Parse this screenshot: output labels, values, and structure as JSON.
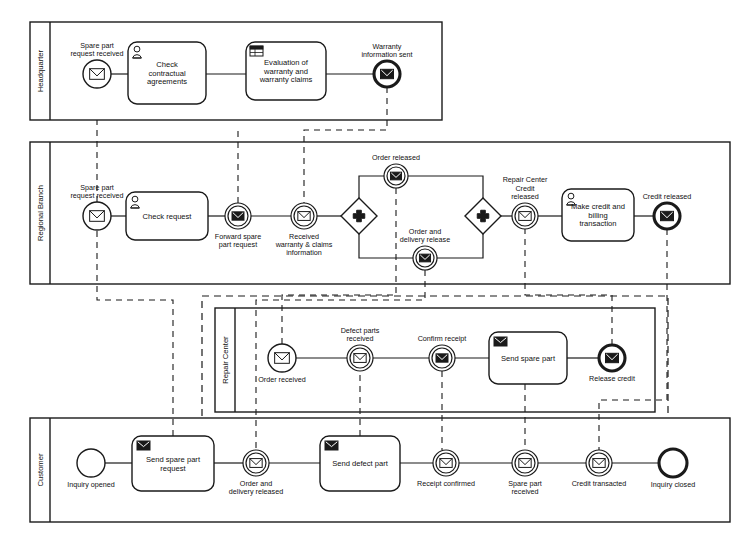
{
  "diagram": {
    "type": "bpmn-collaboration",
    "stroke": "#1a1a1a",
    "fill": "#ffffff"
  },
  "pools": [
    {
      "id": "headquarter",
      "label": "Headquarter",
      "x": 30,
      "y": 22,
      "w": 412,
      "h": 98,
      "header_w": 20,
      "elements": [
        {
          "kind": "start-message-event",
          "name": "spare-part-request-received-hq",
          "label": "Spare part\nrequest received",
          "label_pos": "above",
          "cx": 97,
          "cy": 74,
          "r": 14
        },
        {
          "kind": "task-user",
          "name": "check-contractual-agreements",
          "label": "Check\ncontractual\nagreements",
          "x": 128,
          "y": 42,
          "w": 78,
          "h": 62
        },
        {
          "kind": "task-business-rule",
          "name": "evaluation-of-warranty-and-warranty-claims",
          "label": "Evaluation of\nwarranty and\nwarranty claims",
          "x": 246,
          "y": 42,
          "w": 80,
          "h": 58
        },
        {
          "kind": "end-message-event",
          "name": "warranty-information-sent",
          "label": "Warranty\ninformation sent",
          "label_pos": "above",
          "cx": 387,
          "cy": 74,
          "r": 13
        }
      ]
    },
    {
      "id": "regional-branch",
      "label": "Regional Branch",
      "x": 30,
      "y": 142,
      "w": 700,
      "h": 142,
      "header_w": 20,
      "elements": [
        {
          "kind": "start-message-event",
          "name": "spare-part-request-received-rb",
          "label": "Spare part\nrequest received",
          "label_pos": "above",
          "cx": 97,
          "cy": 216,
          "r": 14
        },
        {
          "kind": "task-user",
          "name": "check-request",
          "label": "Check request",
          "x": 126,
          "y": 192,
          "w": 82,
          "h": 48
        },
        {
          "kind": "intermediate-throw-message-event",
          "name": "forward-spare-part-request",
          "label": "Forward spare\npart request",
          "label_pos": "below",
          "cx": 238,
          "cy": 216,
          "r": 13
        },
        {
          "kind": "intermediate-catch-message-event",
          "name": "received-warranty-and-claims-information",
          "label": "Received\nwarranty & claims\ninformation",
          "label_pos": "below",
          "cx": 304,
          "cy": 216,
          "r": 13
        },
        {
          "kind": "parallel-gateway",
          "name": "parallel-split-gateway",
          "label": "",
          "cx": 359,
          "cy": 216,
          "r": 18
        },
        {
          "kind": "intermediate-throw-message-event",
          "name": "order-released",
          "label": "Order released",
          "label_pos": "above",
          "cx": 396,
          "cy": 176,
          "r": 12
        },
        {
          "kind": "intermediate-throw-message-event",
          "name": "order-and-delivery-release",
          "label": "Order and\ndelivery release",
          "label_pos": "above",
          "cx": 425,
          "cy": 258,
          "r": 12
        },
        {
          "kind": "parallel-gateway",
          "name": "parallel-join-gateway",
          "label": "",
          "cx": 483,
          "cy": 216,
          "r": 18
        },
        {
          "kind": "intermediate-catch-message-event",
          "name": "repair-center-credit-released",
          "label": "Repair Center\nCredit\nreleased",
          "label_pos": "above",
          "cx": 525,
          "cy": 216,
          "r": 13
        },
        {
          "kind": "task-user",
          "name": "make-credit-and-billing-transaction",
          "label": "Make credit and\nbilling\ntransaction",
          "x": 562,
          "y": 189,
          "w": 72,
          "h": 52
        },
        {
          "kind": "end-message-event",
          "name": "credit-released",
          "label": "Credit released",
          "label_pos": "above",
          "cx": 667,
          "cy": 216,
          "r": 13
        }
      ]
    },
    {
      "id": "repair-center",
      "label": "Repair Center",
      "x": 215,
      "y": 308,
      "w": 440,
      "h": 104,
      "header_w": 20,
      "elements": [
        {
          "kind": "start-message-event",
          "name": "order-received",
          "label": "Order received",
          "label_pos": "below",
          "cx": 282,
          "cy": 358,
          "r": 14
        },
        {
          "kind": "intermediate-catch-message-event",
          "name": "defect-parts-received",
          "label": "Defect parts\nreceived",
          "label_pos": "above",
          "cx": 360,
          "cy": 358,
          "r": 13
        },
        {
          "kind": "intermediate-throw-message-event",
          "name": "confirm-receipt",
          "label": "Confirm receipt",
          "label_pos": "above",
          "cx": 442,
          "cy": 358,
          "r": 13
        },
        {
          "kind": "task-send",
          "name": "send-spare-part",
          "label": "Send spare part",
          "x": 489,
          "y": 332,
          "w": 78,
          "h": 52
        },
        {
          "kind": "end-message-event",
          "name": "release-credit",
          "label": "Release credit",
          "label_pos": "below",
          "cx": 612,
          "cy": 358,
          "r": 13
        }
      ]
    },
    {
      "id": "customer",
      "label": "Customer",
      "x": 30,
      "y": 418,
      "w": 700,
      "h": 104,
      "header_w": 20,
      "elements": [
        {
          "kind": "start-event",
          "name": "inquiry-opened",
          "label": "Inquiry opened",
          "label_pos": "below",
          "cx": 91,
          "cy": 463,
          "r": 14
        },
        {
          "kind": "task-send",
          "name": "send-spare-part-request",
          "label": "Send spare part\nrequest",
          "x": 132,
          "y": 436,
          "w": 82,
          "h": 55
        },
        {
          "kind": "intermediate-catch-message-event",
          "name": "order-and-delivery-released",
          "label": "Order and\ndelivery released",
          "label_pos": "below",
          "cx": 256,
          "cy": 463,
          "r": 13
        },
        {
          "kind": "task-send",
          "name": "send-defect-part",
          "label": "Send defect part",
          "x": 320,
          "y": 436,
          "w": 80,
          "h": 55
        },
        {
          "kind": "intermediate-catch-message-event",
          "name": "receipt-confirmed",
          "label": "Receipt confirmed",
          "label_pos": "below",
          "cx": 446,
          "cy": 463,
          "r": 13
        },
        {
          "kind": "intermediate-catch-message-event",
          "name": "spare-part-received",
          "label": "Spare part\nreceived",
          "label_pos": "below",
          "cx": 525,
          "cy": 463,
          "r": 13
        },
        {
          "kind": "intermediate-catch-message-event",
          "name": "credit-transacted",
          "label": "Credit transacted",
          "label_pos": "below",
          "cx": 599,
          "cy": 463,
          "r": 13
        },
        {
          "kind": "end-event",
          "name": "inquiry-closed",
          "label": "Inquiry closed",
          "label_pos": "below",
          "cx": 673,
          "cy": 463,
          "r": 14
        }
      ]
    }
  ],
  "sequence_flows": [
    {
      "name": "flow-hq-1",
      "points": "111,74 128,74"
    },
    {
      "name": "flow-hq-2",
      "points": "206,74 246,74"
    },
    {
      "name": "flow-hq-3",
      "points": "326,74 374,74"
    },
    {
      "name": "flow-rb-1",
      "points": "111,216 126,216"
    },
    {
      "name": "flow-rb-2",
      "points": "208,216 225,216"
    },
    {
      "name": "flow-rb-3",
      "points": "251,216 291,216"
    },
    {
      "name": "flow-rb-4",
      "points": "317,216 341,216"
    },
    {
      "name": "flow-rb-split-top",
      "points": "359,198 359,176 384,176"
    },
    {
      "name": "flow-rb-split-bottom",
      "points": "359,234 359,258 413,258"
    },
    {
      "name": "flow-rb-join-top",
      "points": "408,176 483,176 483,198"
    },
    {
      "name": "flow-rb-join-bottom",
      "points": "437,258 483,258 483,234"
    },
    {
      "name": "flow-rb-5",
      "points": "501,216 512,216"
    },
    {
      "name": "flow-rb-6",
      "points": "538,216 562,216"
    },
    {
      "name": "flow-rb-7",
      "points": "634,216 654,216"
    },
    {
      "name": "flow-rc-1",
      "points": "296,358 347,358"
    },
    {
      "name": "flow-rc-2",
      "points": "373,358 429,358"
    },
    {
      "name": "flow-rc-3",
      "points": "455,358 489,358"
    },
    {
      "name": "flow-rc-4",
      "points": "567,358 599,358"
    },
    {
      "name": "flow-cu-1",
      "points": "105,463 132,463"
    },
    {
      "name": "flow-cu-2",
      "points": "214,463 243,463"
    },
    {
      "name": "flow-cu-3",
      "points": "269,463 320,463"
    },
    {
      "name": "flow-cu-4",
      "points": "400,463 433,463"
    },
    {
      "name": "flow-cu-5",
      "points": "459,463 512,463"
    },
    {
      "name": "flow-cu-6",
      "points": "538,463 586,463"
    },
    {
      "name": "flow-cu-7",
      "points": "612,463 659,463"
    }
  ],
  "message_flows": [
    {
      "name": "msgflow-customer-request-to-rb",
      "points": "173,436 173,300 97,300 97,230"
    },
    {
      "name": "msgflow-rb-to-hq",
      "points": "97,202 97,120"
    },
    {
      "name": "msgflow-hq-to-rb",
      "points": "387,87 387,130 304,130 304,203"
    },
    {
      "name": "msgflow-forward-to-hq",
      "points": "238,203 238,130"
    },
    {
      "name": "msgflow-rb-order-to-rc",
      "points": "396,188 396,295 282,295 282,344"
    },
    {
      "name": "msgflow-rb-delivery-to-customer",
      "points": "425,270 425,300 256,300 256,450"
    },
    {
      "name": "msgflow-customer-defect-to-rc",
      "points": "360,436 360,371"
    },
    {
      "name": "msgflow-rc-confirm-to-customer",
      "points": "442,371 442,450"
    },
    {
      "name": "msgflow-rc-spare-to-customer",
      "points": "525,384 525,450"
    },
    {
      "name": "msgflow-rc-credit-to-rb",
      "points": "612,345 612,295 525,295 525,229"
    },
    {
      "name": "msgflow-rb-credit-to-customer",
      "points": "667,229 667,400 599,400 599,450"
    }
  ],
  "icons": {
    "envelope": "envelope-icon",
    "user": "user-icon",
    "business-rule": "business-rule-table-icon",
    "plus": "plus-icon"
  }
}
